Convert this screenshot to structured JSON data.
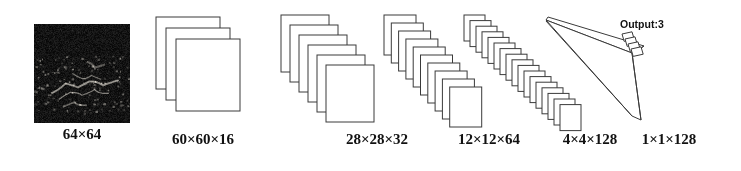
{
  "figure": {
    "type": "cnn-architecture-diagram",
    "title": "",
    "background_color": "#ffffff",
    "line_color": "#3a3a3a",
    "text_color": "#111111"
  },
  "input": {
    "name": "input-sar-image",
    "label": "64×64",
    "description": "dark speckled grayscale image",
    "box": {
      "x": 34,
      "y": 24,
      "w": 96,
      "h": 99
    },
    "label_pos": {
      "x": 34,
      "y": 126,
      "w": 96
    }
  },
  "layers": [
    {
      "id": "conv1",
      "label": "60×60×16",
      "kind": "feature-map-stack",
      "plates": 3,
      "plate_w": 64,
      "plate_h": 72,
      "start_x": 156,
      "start_y": 17,
      "step_x": 10,
      "step_y": 11,
      "label_pos": {
        "x": 138,
        "y": 131,
        "w": 130
      }
    },
    {
      "id": "conv2",
      "label": "28×28×32",
      "kind": "feature-map-stack",
      "plates": 6,
      "plate_w": 48,
      "plate_h": 57,
      "start_x": 281,
      "start_y": 15,
      "step_x": 9,
      "step_y": 10,
      "label_pos": {
        "x": 322,
        "y": 131,
        "w": 110
      }
    },
    {
      "id": "conv3",
      "label": "12×12×64",
      "kind": "feature-map-stack",
      "plates": 10,
      "plate_w": 32,
      "plate_h": 40,
      "start_x": 384,
      "start_y": 15,
      "step_x": 7.3,
      "step_y": 8,
      "label_pos": {
        "x": 434,
        "y": 131,
        "w": 110
      }
    },
    {
      "id": "conv4",
      "label": "4×4×128",
      "kind": "feature-map-stack",
      "plates": 17,
      "plate_w": 21,
      "plate_h": 26,
      "start_x": 464,
      "start_y": 15,
      "step_x": 6.0,
      "step_y": 5.6,
      "label_pos": {
        "x": 540,
        "y": 131,
        "w": 100
      }
    },
    {
      "id": "fc1",
      "label": "1×1×128",
      "kind": "fully-connected-cone",
      "apex": {
        "x": 548,
        "y": 17
      },
      "bar_top": {
        "x": 644,
        "y": 46
      },
      "bar_bottom": {
        "x": 641,
        "y": 120
      },
      "label_pos": {
        "x": 614,
        "y": 131,
        "w": 110
      }
    }
  ],
  "output": {
    "name": "output-node",
    "label": "Output:3",
    "classes": 3,
    "label_pos": {
      "x": 620,
      "y": 18
    },
    "cells": 4
  }
}
